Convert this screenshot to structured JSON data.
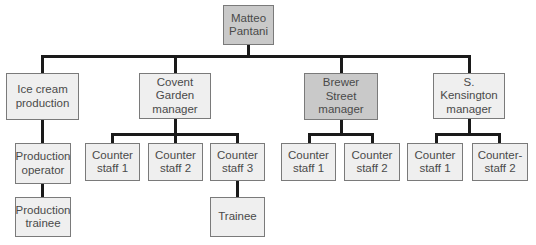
{
  "chart": {
    "colors": {
      "highlight_fill": "#c9c9c9",
      "default_fill": "#efefef",
      "connector": "#1a1a1a",
      "border": "#7a7a7a",
      "text": "#4a4a4a"
    },
    "root": {
      "label": "Matteo\nPantani",
      "highlighted": true
    },
    "departments": [
      {
        "label": "Ice cream\nproduction",
        "highlighted": false,
        "chain": [
          {
            "label": "Production\noperator"
          },
          {
            "label": "Production\ntrainee"
          }
        ]
      },
      {
        "label": "Covent\nGarden\nmanager",
        "highlighted": false,
        "staff": [
          {
            "label": "Counter\nstaff 1"
          },
          {
            "label": "Counter\nstaff 2"
          },
          {
            "label": "Counter\nstaff 3",
            "reports": [
              {
                "label": "Trainee"
              }
            ]
          }
        ]
      },
      {
        "label": "Brewer\nStreet\nmanager",
        "highlighted": true,
        "staff": [
          {
            "label": "Counter\nstaff 1"
          },
          {
            "label": "Counter\nstaff 2"
          }
        ]
      },
      {
        "label": "S. Kensington\nmanager",
        "highlighted": false,
        "staff": [
          {
            "label": "Counter\nstaff 1"
          },
          {
            "label": "Counter-\nstaff 2"
          }
        ]
      }
    ]
  }
}
